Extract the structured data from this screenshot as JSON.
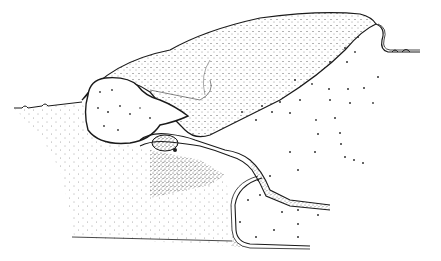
{
  "figure": {
    "kind": "stippled scientific cross-section illustration",
    "background": "#ffffff",
    "ink": "#1a1a1a",
    "labels": []
  }
}
